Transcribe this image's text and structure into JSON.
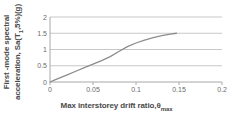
{
  "chart_data": {
    "type": "line",
    "title": "",
    "xlabel": "Max interstorey drift ratio,θmax",
    "xlabel_main": "Max interstorey drift ratio,θ",
    "xlabel_sub": "max",
    "ylabel": "First -mode spectral acceleration, Sa(T1,5%)(g)",
    "ylabel_line1": "First -mode spectral",
    "ylabel_line2_a": "acceleration, Sa(T",
    "ylabel_line2_sub": "1",
    "ylabel_line2_b": ",5%)(g)",
    "xlim": [
      0,
      0.2
    ],
    "ylim": [
      0,
      2
    ],
    "xticks": [
      0,
      0.05,
      0.1,
      0.15,
      0.2
    ],
    "xticklabels": [
      "0",
      "0.05",
      "0.1",
      "0.15",
      "0.2"
    ],
    "yticks": [
      0,
      0.5,
      1,
      1.5,
      2
    ],
    "yticklabels": [
      "0",
      "0.5",
      "1",
      "1.5",
      "2"
    ],
    "grid": "horizontal",
    "grid_color": "#c8c8c8",
    "axis_color": "#a8a8a8",
    "line_color": "#8c8c8c",
    "line_width": 1.3,
    "legend": "none",
    "series": [
      {
        "name": "IDA capacity curve",
        "x": [
          0.0,
          0.005,
          0.01,
          0.02,
          0.03,
          0.04,
          0.05,
          0.06,
          0.07,
          0.08,
          0.09,
          0.1,
          0.11,
          0.12,
          0.13,
          0.14,
          0.147
        ],
        "y": [
          0.0,
          0.055,
          0.11,
          0.22,
          0.33,
          0.44,
          0.55,
          0.66,
          0.78,
          0.94,
          1.09,
          1.2,
          1.29,
          1.365,
          1.425,
          1.47,
          1.5
        ]
      }
    ]
  }
}
